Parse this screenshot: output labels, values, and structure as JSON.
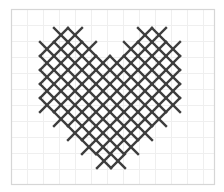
{
  "image": {
    "description": "Cross-stitch heart pattern on a light grid",
    "background": "#ffffff",
    "frame": {
      "x": 11,
      "y": 9,
      "width": 203,
      "height": 175,
      "stroke": "#d6d6d6"
    },
    "grid": {
      "cell": 16,
      "origin_x": 11,
      "origin_y": 9,
      "stroke": "#efefef"
    },
    "stitch": {
      "size": 14,
      "color": "#3d3d3d",
      "stroke_width": 2.4
    },
    "stitches": [
      [
        54,
        28
      ],
      [
        68,
        28
      ],
      [
        138,
        28
      ],
      [
        152,
        28
      ],
      [
        40,
        42
      ],
      [
        54,
        42
      ],
      [
        68,
        42
      ],
      [
        82,
        42
      ],
      [
        124,
        42
      ],
      [
        138,
        42
      ],
      [
        152,
        42
      ],
      [
        166,
        42
      ],
      [
        40,
        56
      ],
      [
        54,
        56
      ],
      [
        68,
        56
      ],
      [
        82,
        56
      ],
      [
        96,
        56
      ],
      [
        110,
        56
      ],
      [
        124,
        56
      ],
      [
        138,
        56
      ],
      [
        152,
        56
      ],
      [
        166,
        56
      ],
      [
        40,
        70
      ],
      [
        54,
        70
      ],
      [
        68,
        70
      ],
      [
        82,
        70
      ],
      [
        96,
        70
      ],
      [
        110,
        70
      ],
      [
        124,
        70
      ],
      [
        138,
        70
      ],
      [
        152,
        70
      ],
      [
        166,
        70
      ],
      [
        40,
        84
      ],
      [
        54,
        84
      ],
      [
        68,
        84
      ],
      [
        82,
        84
      ],
      [
        96,
        84
      ],
      [
        110,
        84
      ],
      [
        124,
        84
      ],
      [
        138,
        84
      ],
      [
        152,
        84
      ],
      [
        166,
        84
      ],
      [
        40,
        98
      ],
      [
        54,
        98
      ],
      [
        68,
        98
      ],
      [
        82,
        98
      ],
      [
        96,
        98
      ],
      [
        110,
        98
      ],
      [
        124,
        98
      ],
      [
        138,
        98
      ],
      [
        152,
        98
      ],
      [
        166,
        98
      ],
      [
        54,
        112
      ],
      [
        68,
        112
      ],
      [
        82,
        112
      ],
      [
        96,
        112
      ],
      [
        110,
        112
      ],
      [
        124,
        112
      ],
      [
        138,
        112
      ],
      [
        152,
        112
      ],
      [
        68,
        126
      ],
      [
        82,
        126
      ],
      [
        96,
        126
      ],
      [
        110,
        126
      ],
      [
        124,
        126
      ],
      [
        138,
        126
      ],
      [
        82,
        140
      ],
      [
        96,
        140
      ],
      [
        110,
        140
      ],
      [
        124,
        140
      ],
      [
        97,
        154
      ],
      [
        111,
        154
      ]
    ]
  }
}
